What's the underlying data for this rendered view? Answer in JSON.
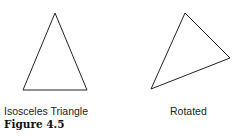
{
  "figure": {
    "caption": "Figure 4.5",
    "shapes": [
      {
        "label": "Isosceles Triangle",
        "points": "55,13 23,90 87,90"
      },
      {
        "label": "Rotated",
        "points": "185,13 230,58 151,89"
      }
    ],
    "stroke_color": "#222222"
  }
}
